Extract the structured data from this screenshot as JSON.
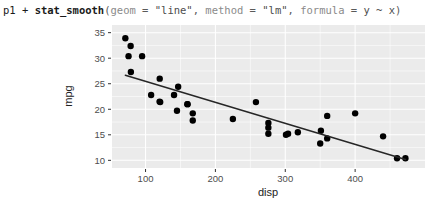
{
  "console": {
    "prompt_line": "p1 + stat_smooth(geom = \"line\", method = \"lm\", formula = y ~ x)",
    "tokens": {
      "obj": "p1",
      "plus": " + ",
      "fn": "stat_smooth",
      "open": "(",
      "arg1": "geom",
      "eq1": " = ",
      "val1": "\"line\"",
      "comma1": ", ",
      "arg2": "method",
      "eq2": " = ",
      "val2": "\"lm\"",
      "comma2": ", ",
      "arg3": "formula",
      "eq3": " = ",
      "val3": "y ~ x",
      "close": ")"
    }
  },
  "colors": {
    "panel_background": "#ebebeb",
    "gridline": "#ffffff",
    "point": "#000000",
    "fit_line": "#262626",
    "axis_text": "#4d4d4d",
    "axis_title": "#222222",
    "page_background": "#ffffff"
  },
  "chart_data": {
    "type": "scatter",
    "title": "",
    "subtitle": "",
    "xlabel": "disp",
    "ylabel": "mpg",
    "xlim": [
      52,
      500
    ],
    "ylim": [
      8.5,
      36.5
    ],
    "xticks": [
      100,
      200,
      300,
      400
    ],
    "yticks": [
      10,
      15,
      20,
      25,
      30,
      35
    ],
    "xticklabels": [
      "100",
      "200",
      "300",
      "400"
    ],
    "yticklabels": [
      "10",
      "15",
      "20",
      "25",
      "30",
      "35"
    ],
    "grid": true,
    "grid_minor": true,
    "legend": "none",
    "series": [
      {
        "name": "mtcars",
        "marker": "filled-circle",
        "marker_size_px": 3.2,
        "points": [
          {
            "x": 160.0,
            "y": 21.0
          },
          {
            "x": 160.0,
            "y": 21.0
          },
          {
            "x": 108.0,
            "y": 22.8
          },
          {
            "x": 258.0,
            "y": 21.4
          },
          {
            "x": 360.0,
            "y": 18.7
          },
          {
            "x": 225.0,
            "y": 18.1
          },
          {
            "x": 360.0,
            "y": 14.3
          },
          {
            "x": 146.7,
            "y": 24.4
          },
          {
            "x": 140.8,
            "y": 22.8
          },
          {
            "x": 167.6,
            "y": 19.2
          },
          {
            "x": 167.6,
            "y": 17.8
          },
          {
            "x": 275.8,
            "y": 16.4
          },
          {
            "x": 275.8,
            "y": 17.3
          },
          {
            "x": 275.8,
            "y": 15.2
          },
          {
            "x": 472.0,
            "y": 10.4
          },
          {
            "x": 460.0,
            "y": 10.4
          },
          {
            "x": 440.0,
            "y": 14.7
          },
          {
            "x": 78.7,
            "y": 32.4
          },
          {
            "x": 75.7,
            "y": 30.4
          },
          {
            "x": 71.1,
            "y": 33.9
          },
          {
            "x": 120.1,
            "y": 21.5
          },
          {
            "x": 318.0,
            "y": 15.5
          },
          {
            "x": 304.0,
            "y": 15.2
          },
          {
            "x": 350.0,
            "y": 13.3
          },
          {
            "x": 400.0,
            "y": 19.2
          },
          {
            "x": 79.0,
            "y": 27.3
          },
          {
            "x": 120.3,
            "y": 26.0
          },
          {
            "x": 95.1,
            "y": 30.4
          },
          {
            "x": 351.0,
            "y": 15.8
          },
          {
            "x": 145.0,
            "y": 19.7
          },
          {
            "x": 301.0,
            "y": 15.0
          },
          {
            "x": 121.0,
            "y": 21.4
          }
        ]
      }
    ],
    "fit": {
      "name": "lm",
      "geom": "line",
      "formula": "y ~ x",
      "intercept": 29.5999,
      "slope": -0.041215,
      "x_start": 71.1,
      "x_end": 472.0,
      "y_start": 26.67,
      "y_end": 10.15,
      "show_se": false
    }
  }
}
